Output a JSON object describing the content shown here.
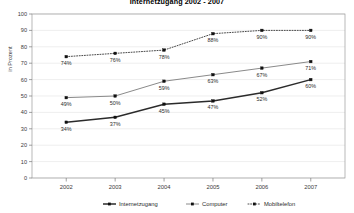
{
  "chart_data": {
    "type": "line",
    "title": "Internetzugang 2002 - 2007",
    "xlabel": "",
    "ylabel": "in Prozent",
    "categories": [
      "2002",
      "2003",
      "2004",
      "2005",
      "2006",
      "2007"
    ],
    "ylim": [
      0,
      100
    ],
    "yticks": [
      0,
      10,
      20,
      30,
      40,
      50,
      60,
      70,
      80,
      90,
      100
    ],
    "ytick_labels": [
      "0",
      "10",
      "20",
      "30",
      "40",
      "50",
      "60",
      "70",
      "80",
      "90",
      "100"
    ],
    "grid": true,
    "legend_position": "bottom",
    "series": [
      {
        "name": "Internetzugang",
        "values": [
          34,
          37,
          45,
          47,
          52,
          60
        ],
        "labels": [
          "34%",
          "37%",
          "45%",
          "47%",
          "52%",
          "60%"
        ],
        "line_style": "solid",
        "color": "#2b2b2b",
        "width": 1.5,
        "marker": "square"
      },
      {
        "name": "Computer",
        "values": [
          49,
          50,
          59,
          63,
          67,
          71
        ],
        "labels": [
          "49%",
          "50%",
          "59%",
          "63%",
          "67%",
          "71%"
        ],
        "line_style": "solid",
        "color": "#8a8a8a",
        "width": 1.0,
        "marker": "square"
      },
      {
        "name": "Mobiltelefon",
        "values": [
          74,
          76,
          78,
          88,
          90,
          90
        ],
        "labels": [
          "74%",
          "76%",
          "78%",
          "88%",
          "90%",
          "90%"
        ],
        "line_style": "dotted",
        "color": "#4a4a4a",
        "width": 1.0,
        "marker": "square"
      }
    ]
  },
  "legend": {
    "items": [
      {
        "label": "Internetzugang"
      },
      {
        "label": "Computer"
      },
      {
        "label": "Mobiltelefon"
      }
    ]
  }
}
